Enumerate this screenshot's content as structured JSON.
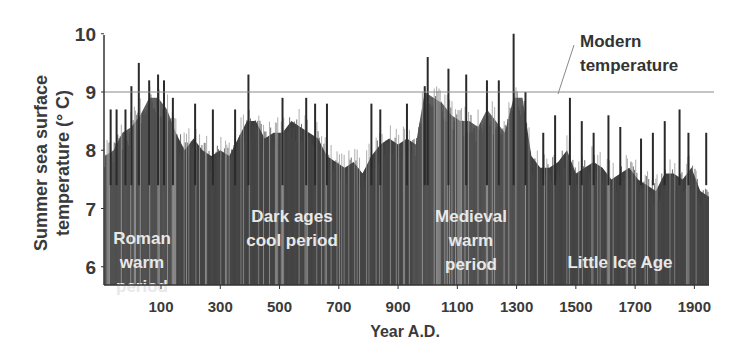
{
  "chart_data": {
    "type": "area",
    "title": "",
    "xlabel": "Year A.D.",
    "ylabel": "Summer sea surface temperature (° C)",
    "ylabel_lines": [
      "Summer sea surface",
      "temperature (° C)"
    ],
    "xlim": [
      -90,
      1950
    ],
    "ylim": [
      5.7,
      10
    ],
    "x_ticks": [
      100,
      300,
      500,
      700,
      900,
      1100,
      1300,
      1500,
      1700,
      1900
    ],
    "y_ticks": [
      6,
      7,
      8,
      9,
      10
    ],
    "grid": false,
    "reference_line": {
      "label": "Modern temperature",
      "label_lines": [
        "Modern",
        "temperature"
      ],
      "value": 9.0
    },
    "periods": [
      {
        "name": "Roman warm period",
        "label_lines": [
          "Roman",
          "warm",
          "period"
        ],
        "start": -90,
        "end": 150,
        "type": "warm"
      },
      {
        "name": "Dark ages cool period",
        "label_lines": [
          "Dark ages",
          "cool period"
        ],
        "start": 150,
        "end": 950,
        "type": "cool"
      },
      {
        "name": "Medieval warm period",
        "label_lines": [
          "Medieval",
          "warm",
          "period"
        ],
        "start": 950,
        "end": 1330,
        "type": "warm"
      },
      {
        "name": "Little Ice Age",
        "label_lines": [
          "Little Ice Age"
        ],
        "start": 1330,
        "end": 1950,
        "type": "cool"
      }
    ],
    "series": [
      {
        "name": "Summer SST (smoothed envelope)",
        "x": [
          -90,
          -60,
          -30,
          0,
          30,
          60,
          90,
          120,
          150,
          180,
          210,
          240,
          270,
          300,
          330,
          360,
          390,
          420,
          450,
          480,
          510,
          540,
          570,
          600,
          630,
          660,
          690,
          720,
          750,
          780,
          810,
          840,
          870,
          900,
          930,
          960,
          990,
          1020,
          1050,
          1080,
          1110,
          1140,
          1170,
          1200,
          1230,
          1260,
          1290,
          1320,
          1350,
          1380,
          1410,
          1440,
          1470,
          1500,
          1530,
          1560,
          1590,
          1620,
          1650,
          1680,
          1710,
          1740,
          1770,
          1800,
          1830,
          1860,
          1890,
          1920,
          1950
        ],
        "values": [
          7.9,
          8.0,
          8.3,
          8.4,
          8.6,
          8.9,
          8.9,
          8.7,
          8.3,
          8.0,
          8.2,
          8.0,
          7.9,
          8.0,
          7.9,
          8.2,
          8.5,
          8.5,
          8.2,
          8.3,
          8.3,
          8.5,
          8.4,
          8.3,
          8.2,
          7.9,
          7.8,
          7.7,
          7.8,
          7.6,
          7.9,
          8.1,
          8.2,
          8.1,
          8.2,
          8.1,
          9.0,
          8.9,
          8.8,
          8.6,
          8.5,
          8.5,
          8.4,
          8.7,
          8.5,
          8.3,
          8.9,
          8.9,
          7.9,
          7.7,
          7.7,
          7.8,
          8.0,
          7.6,
          7.7,
          7.8,
          7.7,
          7.5,
          7.6,
          7.7,
          7.5,
          7.4,
          7.3,
          7.6,
          7.6,
          7.5,
          7.7,
          7.3,
          7.2
        ]
      },
      {
        "name": "Summer SST (peak spikes)",
        "x": [
          -70,
          -50,
          -20,
          0,
          25,
          60,
          90,
          110,
          140,
          215,
          275,
          350,
          395,
          510,
          590,
          620,
          660,
          810,
          840,
          930,
          990,
          1000,
          1070,
          1130,
          1200,
          1240,
          1290,
          1330,
          1390,
          1430,
          1480,
          1520,
          1560,
          1610,
          1650,
          1720,
          1760,
          1800,
          1850,
          1880,
          1940
        ],
        "values": [
          8.7,
          8.7,
          8.7,
          9.1,
          9.5,
          9.2,
          9.3,
          9.2,
          8.9,
          8.8,
          8.7,
          8.7,
          9.3,
          8.9,
          8.9,
          8.8,
          8.8,
          8.8,
          8.7,
          8.8,
          9.1,
          9.6,
          9.4,
          9.3,
          9.2,
          9.2,
          10.0,
          9.0,
          8.3,
          8.6,
          8.9,
          8.5,
          8.3,
          8.6,
          8.4,
          8.2,
          8.3,
          8.5,
          8.7,
          8.3,
          8.3
        ]
      }
    ]
  },
  "colors": {
    "warm_fill": "#5e5e5e",
    "cool_fill": "#3e3e3e",
    "spike": "#2a2a2a",
    "reference_line": "#8a8a8a",
    "axis": "#333333"
  }
}
